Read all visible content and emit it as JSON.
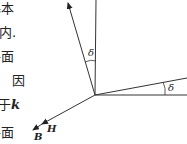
{
  "text_fragments": [
    {
      "text": "基本",
      "top": 2,
      "left": -12
    },
    {
      "text": "内.",
      "top": 26,
      "left": -1
    },
    {
      "text": "平面",
      "top": 50,
      "left": -12
    },
    {
      "text": "因",
      "top": 74,
      "left": 12
    },
    {
      "text": "于",
      "top": 98,
      "left": -2,
      "var": "k"
    },
    {
      "text": "平面",
      "top": 126,
      "left": -12
    }
  ],
  "figure": {
    "angle_label_upper": "δ",
    "angle_label_right": "δ",
    "vector_H_label": "H",
    "vector_B_label": "B"
  }
}
